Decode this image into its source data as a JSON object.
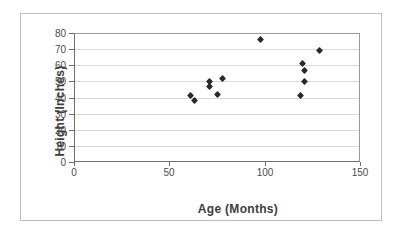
{
  "chart_data": {
    "type": "scatter",
    "title": "",
    "xlabel": "Age (Months)",
    "ylabel": "Height (Inches)",
    "xlim": [
      0,
      150
    ],
    "ylim": [
      0,
      80
    ],
    "x_ticks": [
      0,
      50,
      100,
      150
    ],
    "y_ticks": [
      0,
      10,
      20,
      30,
      40,
      50,
      60,
      70,
      80
    ],
    "grid": "horizontal gridlines at every y tick",
    "legend_position": "none",
    "marker": {
      "shape": "diamond",
      "color": "#2a2a2a"
    },
    "points": [
      {
        "x": 61,
        "y": 41
      },
      {
        "x": 63,
        "y": 38
      },
      {
        "x": 71,
        "y": 50
      },
      {
        "x": 71,
        "y": 47
      },
      {
        "x": 75,
        "y": 42
      },
      {
        "x": 78,
        "y": 52
      },
      {
        "x": 98,
        "y": 76
      },
      {
        "x": 119,
        "y": 41
      },
      {
        "x": 120,
        "y": 61
      },
      {
        "x": 121,
        "y": 57
      },
      {
        "x": 121,
        "y": 50
      },
      {
        "x": 129,
        "y": 69
      }
    ],
    "colors": {
      "marker": "#2a2a2a",
      "gridline": "#d9d9d9",
      "axis_line": "#6f6f6f",
      "plot_border": "#9a9a9a",
      "frame_border": "#bdbdbd",
      "tick_text": "#4c4c4c",
      "axis_title_text": "#3c3c3c",
      "background": "#ffffff"
    }
  }
}
